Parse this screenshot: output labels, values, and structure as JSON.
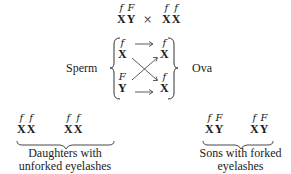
{
  "cross": {
    "male": [
      {
        "allele": "f",
        "chrom": "X"
      },
      {
        "allele": "F",
        "chrom": "Y"
      }
    ],
    "operator": "×",
    "female": [
      {
        "allele": "f",
        "chrom": "X"
      },
      {
        "allele": "f",
        "chrom": "X"
      }
    ]
  },
  "gametes": {
    "sperm_label": "Sperm",
    "ova_label": "Ova",
    "sperm": [
      {
        "allele": "f",
        "chrom": "X"
      },
      {
        "allele": "F",
        "chrom": "Y"
      }
    ],
    "ova": [
      {
        "allele": "f",
        "chrom": "X"
      },
      {
        "allele": "f",
        "chrom": "X"
      }
    ]
  },
  "offspring": {
    "daughters": {
      "genotypes": [
        [
          {
            "allele": "f",
            "chrom": "X"
          },
          {
            "allele": "f",
            "chrom": "X"
          }
        ],
        [
          {
            "allele": "f",
            "chrom": "X"
          },
          {
            "allele": "f",
            "chrom": "X"
          }
        ]
      ],
      "label_line1": "Daughters with",
      "label_line2": "unforked eyelashes"
    },
    "sons": {
      "genotypes": [
        [
          {
            "allele": "f",
            "chrom": "X"
          },
          {
            "allele": "F",
            "chrom": "Y"
          }
        ],
        [
          {
            "allele": "f",
            "chrom": "X"
          },
          {
            "allele": "F",
            "chrom": "Y"
          }
        ]
      ],
      "label_line1": "Sons with forked",
      "label_line2": "eyelashes"
    }
  }
}
